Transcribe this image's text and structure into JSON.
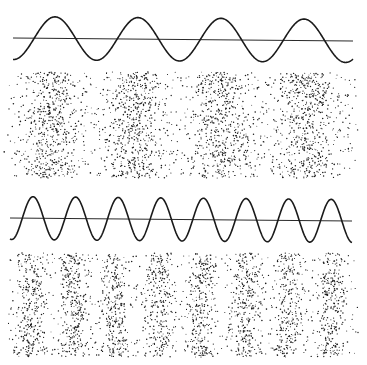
{
  "figure": {
    "colors": {
      "ink": "#1a1a1a",
      "background": "#ffffff"
    }
  },
  "panels": [
    {
      "name": "low-frequency",
      "wave": {
        "x_start": 13,
        "x_end": 353,
        "baseline_y_start": 38,
        "baseline_y_end": 41,
        "amplitude": 21.5,
        "period": 83,
        "first_peak_x": 55,
        "cycles": 4
      },
      "particles": {
        "y_top": 72,
        "y_bottom": 178,
        "centers": [
          50,
          135,
          223,
          308
        ],
        "spread": 17,
        "count": 2600,
        "seed": 7
      }
    },
    {
      "name": "high-frequency",
      "wave": {
        "x_start": 10,
        "x_end": 352,
        "baseline_y_start": 218,
        "baseline_y_end": 221,
        "amplitude": 21.5,
        "period": 42.6,
        "first_peak_x": 33,
        "cycles": 8
      },
      "particles": {
        "y_top": 253,
        "y_bottom": 357,
        "centers": [
          31,
          73,
          116,
          159,
          202,
          245,
          288,
          331
        ],
        "spread": 7.5,
        "count": 2700,
        "seed": 13
      }
    }
  ]
}
